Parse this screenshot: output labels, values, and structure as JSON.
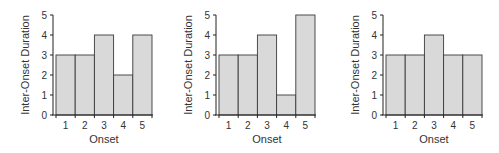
{
  "chart_data": [
    {
      "type": "bar",
      "title": "",
      "categories": [
        "1",
        "2",
        "3",
        "4",
        "5"
      ],
      "values": [
        3,
        3,
        4,
        2,
        4
      ],
      "xlabel": "Onset",
      "ylabel": "Inter-Onset Duration",
      "ylim": [
        0,
        5
      ],
      "yticks": [
        0,
        1,
        2,
        3,
        4,
        5
      ],
      "grid": false,
      "legend": null
    },
    {
      "type": "bar",
      "title": "",
      "categories": [
        "1",
        "2",
        "3",
        "4",
        "5"
      ],
      "values": [
        3,
        3,
        4,
        1,
        5
      ],
      "xlabel": "Onset",
      "ylabel": "Inter-Onset Duration",
      "ylim": [
        0,
        5
      ],
      "yticks": [
        0,
        1,
        2,
        3,
        4,
        5
      ],
      "grid": false,
      "legend": null
    },
    {
      "type": "bar",
      "title": "",
      "categories": [
        "1",
        "2",
        "3",
        "4",
        "5"
      ],
      "values": [
        3,
        3,
        4,
        3,
        3
      ],
      "xlabel": "Onset",
      "ylabel": "Inter-Onset Duration",
      "ylim": [
        0,
        5
      ],
      "yticks": [
        0,
        1,
        2,
        3,
        4,
        5
      ],
      "grid": false,
      "legend": null
    }
  ],
  "style": {
    "bar_fill": "#d9d9d9",
    "bar_edge": "#3a3a3a",
    "axis_color": "#222222"
  }
}
